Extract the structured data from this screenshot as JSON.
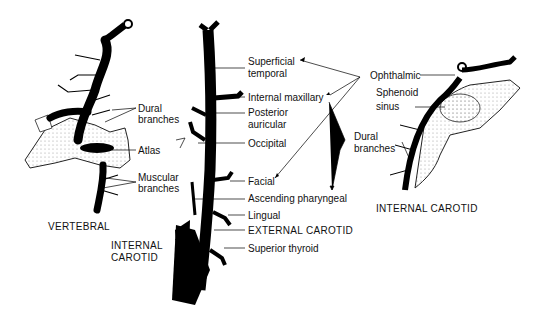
{
  "diagram": {
    "panels": [
      {
        "id": "vertebral",
        "caption": "VERTEBRAL",
        "labels": [
          "Dural branches",
          "Atlas",
          "Muscular branches"
        ]
      },
      {
        "id": "external-carotid",
        "caption": "EXTERNAL CAROTID",
        "secondary_caption": "INTERNAL CAROTID",
        "labels": [
          "Superficial temporal",
          "Internal maxillary",
          "Posterior auricular",
          "Occipital",
          "Facial",
          "Ascending pharyngeal",
          "Lingual",
          "Superior thyroid"
        ]
      },
      {
        "id": "internal-carotid",
        "caption": "INTERNAL CAROTID",
        "labels": [
          "Ophthalmic",
          "Sphenoid sinus",
          "Dural branches"
        ]
      }
    ],
    "text": {
      "vertebral_dural_1": "Dural",
      "vertebral_dural_2": "branches",
      "atlas": "Atlas",
      "muscular_1": "Muscular",
      "muscular_2": "branches",
      "vertebral_caption": "VERTEBRAL",
      "internal_carotid_left_1": "INTERNAL",
      "internal_carotid_left_2": "CAROTID",
      "superficial_1": "Superficial",
      "superficial_2": "temporal",
      "internal_maxillary": "Internal maxillary",
      "posterior_1": "Posterior",
      "posterior_2": "auricular",
      "occipital": "Occipital",
      "facial": "Facial",
      "ascending_pharyngeal": "Ascending pharyngeal",
      "lingual": "Lingual",
      "external_carotid": "EXTERNAL CAROTID",
      "superior_thyroid": "Superior thyroid",
      "ophthalmic": "Ophthalmic",
      "sphenoid_1": "Sphenoid",
      "sphenoid_2": "sinus",
      "dural_right_1": "Dural",
      "dural_right_2": "branches",
      "internal_carotid_right": "INTERNAL CAROTID"
    }
  }
}
